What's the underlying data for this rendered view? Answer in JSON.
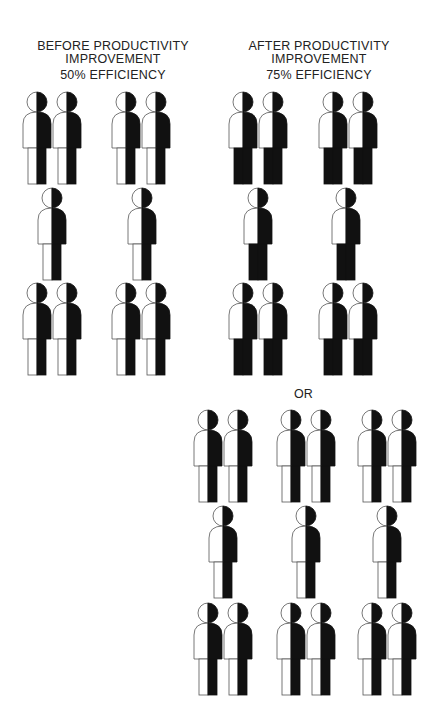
{
  "before": {
    "title_line1": "BEFORE PRODUCTIVITY",
    "title_line2": "IMPROVEMENT",
    "efficiency_label": "50% EFFICIENCY",
    "efficiency_percent": 50,
    "figure_style": "half",
    "figures": [
      {
        "x": 37,
        "y": 92
      },
      {
        "x": 67,
        "y": 92
      },
      {
        "x": 126,
        "y": 92
      },
      {
        "x": 156,
        "y": 92
      },
      {
        "x": 52,
        "y": 188
      },
      {
        "x": 142,
        "y": 188
      },
      {
        "x": 37,
        "y": 283
      },
      {
        "x": 67,
        "y": 283
      },
      {
        "x": 126,
        "y": 283
      },
      {
        "x": 156,
        "y": 283
      }
    ]
  },
  "after": {
    "title_line1": "AFTER PRODUCTIVITY",
    "title_line2": "IMPROVEMENT",
    "efficiency_label": "75% EFFICIENCY",
    "efficiency_percent": 75,
    "figure_style": "three-quarter",
    "figures": [
      {
        "x": 243,
        "y": 92
      },
      {
        "x": 273,
        "y": 92
      },
      {
        "x": 333,
        "y": 92
      },
      {
        "x": 363,
        "y": 92
      },
      {
        "x": 258,
        "y": 188
      },
      {
        "x": 346,
        "y": 188
      },
      {
        "x": 243,
        "y": 283
      },
      {
        "x": 273,
        "y": 283
      },
      {
        "x": 333,
        "y": 283
      },
      {
        "x": 363,
        "y": 283
      }
    ]
  },
  "alternative": {
    "label": "OR",
    "figure_style": "half",
    "figures": [
      {
        "x": 208,
        "y": 410
      },
      {
        "x": 238,
        "y": 410
      },
      {
        "x": 291,
        "y": 410
      },
      {
        "x": 321,
        "y": 410
      },
      {
        "x": 372,
        "y": 410
      },
      {
        "x": 402,
        "y": 410
      },
      {
        "x": 223,
        "y": 506
      },
      {
        "x": 306,
        "y": 506
      },
      {
        "x": 387,
        "y": 506
      },
      {
        "x": 208,
        "y": 603
      },
      {
        "x": 238,
        "y": 603
      },
      {
        "x": 291,
        "y": 603
      },
      {
        "x": 321,
        "y": 603
      },
      {
        "x": 372,
        "y": 603
      },
      {
        "x": 402,
        "y": 603
      }
    ]
  },
  "colors": {
    "fill_dark": "#111111",
    "fill_light": "#ffffff",
    "outline": "#555555"
  }
}
